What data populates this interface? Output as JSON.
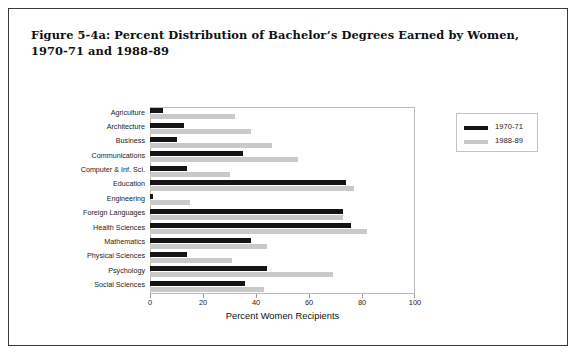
{
  "figure": {
    "title": "Figure 5-4a: Percent Distribution of Bachelor’s Degrees Earned by Women, 1970-71 and 1988-89"
  },
  "legend": {
    "entries": [
      {
        "label": "1970-71",
        "color": "#141414"
      },
      {
        "label": "1988-89",
        "color": "#c9c9c9"
      }
    ]
  },
  "chart_data": {
    "type": "bar",
    "orientation": "horizontal",
    "title": "Figure 5-4a: Percent Distribution of Bachelor’s Degrees Earned by Women, 1970-71 and 1988-89",
    "xlabel": "Percent Women Recipients",
    "ylabel": "",
    "xlim": [
      0,
      100
    ],
    "xticks": [
      0,
      20,
      40,
      60,
      80,
      100
    ],
    "xtick_labels": [
      "0",
      "20",
      "40",
      "60",
      "80",
      "100"
    ],
    "grid": false,
    "legend_position": "right",
    "categories": [
      "Agriculture",
      "Architecture",
      "Business",
      "Communications",
      "Computer & Inf. Sci.",
      "Education",
      "Engineering",
      "Foreign Languages",
      "Health Sciences",
      "Mathematics",
      "Physical Sciences",
      "Psychology",
      "Social Sciences"
    ],
    "series": [
      {
        "name": "1970-71",
        "color": "#141414",
        "values": [
          5,
          13,
          10,
          35,
          14,
          74,
          1,
          73,
          76,
          38,
          14,
          44,
          36
        ]
      },
      {
        "name": "1988-89",
        "color": "#c9c9c9",
        "values": [
          32,
          38,
          46,
          56,
          30,
          77,
          15,
          73,
          82,
          44,
          31,
          69,
          43
        ]
      }
    ]
  }
}
